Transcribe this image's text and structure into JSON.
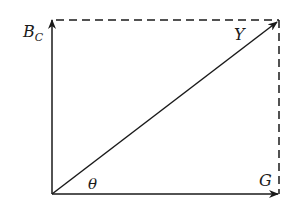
{
  "diagram": {
    "labels": {
      "bc_main": "B",
      "bc_sub": "C",
      "y": "Y",
      "theta": "θ",
      "g": "G"
    },
    "colors": {
      "stroke": "#1a1a1a",
      "background": "#ffffff"
    }
  }
}
